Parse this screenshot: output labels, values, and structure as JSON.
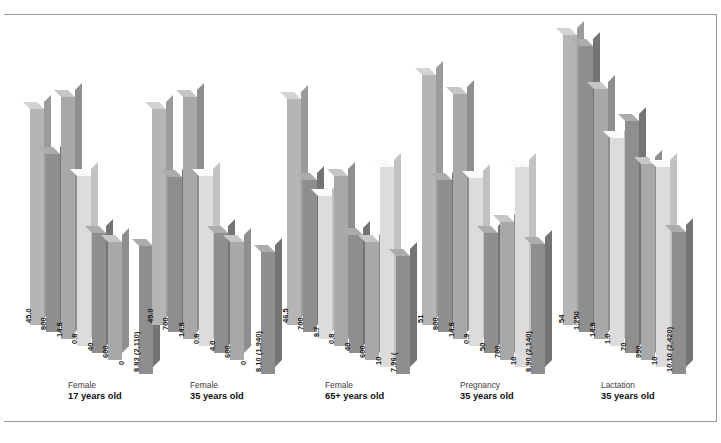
{
  "chart_data": {
    "type": "bar",
    "title": "",
    "subtitle": "",
    "xlabel": "",
    "ylabel": "",
    "grid": false,
    "legend_position": "none",
    "style": "3d-grouped-bar",
    "categories": [
      {
        "line1": "Female",
        "line2": "17 years old"
      },
      {
        "line1": "Female",
        "line2": "35 years old"
      },
      {
        "line1": "Female",
        "line2": "65+ years old"
      },
      {
        "line1": "Pregnancy",
        "line2": "35 years old"
      },
      {
        "line1": "Lactation",
        "line2": "35 years old"
      }
    ],
    "groups": [
      {
        "name": "Female 17 years old",
        "bars": [
          {
            "label": "45.0",
            "value": 45.0,
            "height_px": 216,
            "shade": "light"
          },
          {
            "label": "800",
            "value": 800,
            "height_px": 178,
            "shade": "dark"
          },
          {
            "label": "14.8",
            "value": 14.8,
            "height_px": 242,
            "shade": "mid"
          },
          {
            "label": "0.8",
            "value": 0.8,
            "height_px": 170,
            "shade": "pale"
          },
          {
            "label": "40",
            "value": 40,
            "height_px": 120,
            "shade": "dark"
          },
          {
            "label": "600",
            "value": 600,
            "height_px": 118,
            "shade": "mid"
          },
          {
            "label": "0",
            "value": 0,
            "height_px": 0,
            "shade": "pale"
          },
          {
            "label": "8.83 (2,110)",
            "value": 8.83,
            "height_px": 128,
            "shade": "dark"
          }
        ]
      },
      {
        "name": "Female 35 years old",
        "bars": [
          {
            "label": "45.0",
            "value": 45.0,
            "height_px": 216,
            "shade": "light"
          },
          {
            "label": "700",
            "value": 700,
            "height_px": 155,
            "shade": "dark"
          },
          {
            "label": "14.8",
            "value": 14.8,
            "height_px": 242,
            "shade": "mid"
          },
          {
            "label": "0.8",
            "value": 0.8,
            "height_px": 170,
            "shade": "pale"
          },
          {
            "label": "4.0",
            "value": 4.0,
            "height_px": 120,
            "shade": "dark"
          },
          {
            "label": "600",
            "value": 600,
            "height_px": 118,
            "shade": "mid"
          },
          {
            "label": "0",
            "value": 0,
            "height_px": 0,
            "shade": "pale"
          },
          {
            "label": "8.10 (1,940)",
            "value": 8.1,
            "height_px": 122,
            "shade": "dark"
          }
        ]
      },
      {
        "name": "Female 65+ years old",
        "bars": [
          {
            "label": "46.5",
            "value": 46.5,
            "height_px": 226,
            "shade": "light"
          },
          {
            "label": "700",
            "value": 700,
            "height_px": 152,
            "shade": "dark"
          },
          {
            "label": "8.7",
            "value": 8.7,
            "height_px": 143,
            "shade": "pale"
          },
          {
            "label": "0.8",
            "value": 0.8,
            "height_px": 170,
            "shade": "mid"
          },
          {
            "label": "40",
            "value": 40,
            "height_px": 118,
            "shade": "dark"
          },
          {
            "label": "600",
            "value": 600,
            "height_px": 118,
            "shade": "mid"
          },
          {
            "label": "10",
            "value": 10,
            "height_px": 200,
            "shade": "pale"
          },
          {
            "label": "7.96 (",
            "value": 7.96,
            "height_px": 118,
            "shade": "dark"
          }
        ]
      },
      {
        "name": "Pregnancy 35 years old",
        "bars": [
          {
            "label": "51",
            "value": 51,
            "height_px": 250,
            "shade": "light"
          },
          {
            "label": "800",
            "value": 800,
            "height_px": 152,
            "shade": "dark"
          },
          {
            "label": "14.8",
            "value": 14.8,
            "height_px": 245,
            "shade": "mid"
          },
          {
            "label": "0.9",
            "value": 0.9,
            "height_px": 168,
            "shade": "pale"
          },
          {
            "label": "50",
            "value": 50,
            "height_px": 120,
            "shade": "dark"
          },
          {
            "label": "700",
            "value": 700,
            "height_px": 138,
            "shade": "mid"
          },
          {
            "label": "10",
            "value": 10,
            "height_px": 200,
            "shade": "pale"
          },
          {
            "label": "8.90 (2,140)",
            "value": 8.9,
            "height_px": 130,
            "shade": "dark"
          }
        ]
      },
      {
        "name": "Lactation 35 years old",
        "bars": [
          {
            "label": "54",
            "value": 54,
            "height_px": 290,
            "shade": "light"
          },
          {
            "label": "1,250",
            "value": 1250,
            "height_px": 286,
            "shade": "dark"
          },
          {
            "label": "14.8",
            "value": 14.8,
            "height_px": 250,
            "shade": "mid"
          },
          {
            "label": "1.0",
            "value": 1.0,
            "height_px": 208,
            "shade": "pale"
          },
          {
            "label": "70",
            "value": 70,
            "height_px": 232,
            "shade": "dark"
          },
          {
            "label": "950",
            "value": 950,
            "height_px": 196,
            "shade": "mid"
          },
          {
            "label": "10",
            "value": 10,
            "height_px": 200,
            "shade": "pale"
          },
          {
            "label": "10.10 (2,420)",
            "value": 10.1,
            "height_px": 142,
            "shade": "dark"
          }
        ]
      }
    ],
    "colors": {
      "light": "#b5b5b5",
      "mid": "#a8a8a8",
      "dark": "#8e8e8e",
      "pale": "#dcdcdc",
      "background": "#ffffff",
      "label_text": "#1a1a1a",
      "frame": "#9a9a9a"
    }
  }
}
